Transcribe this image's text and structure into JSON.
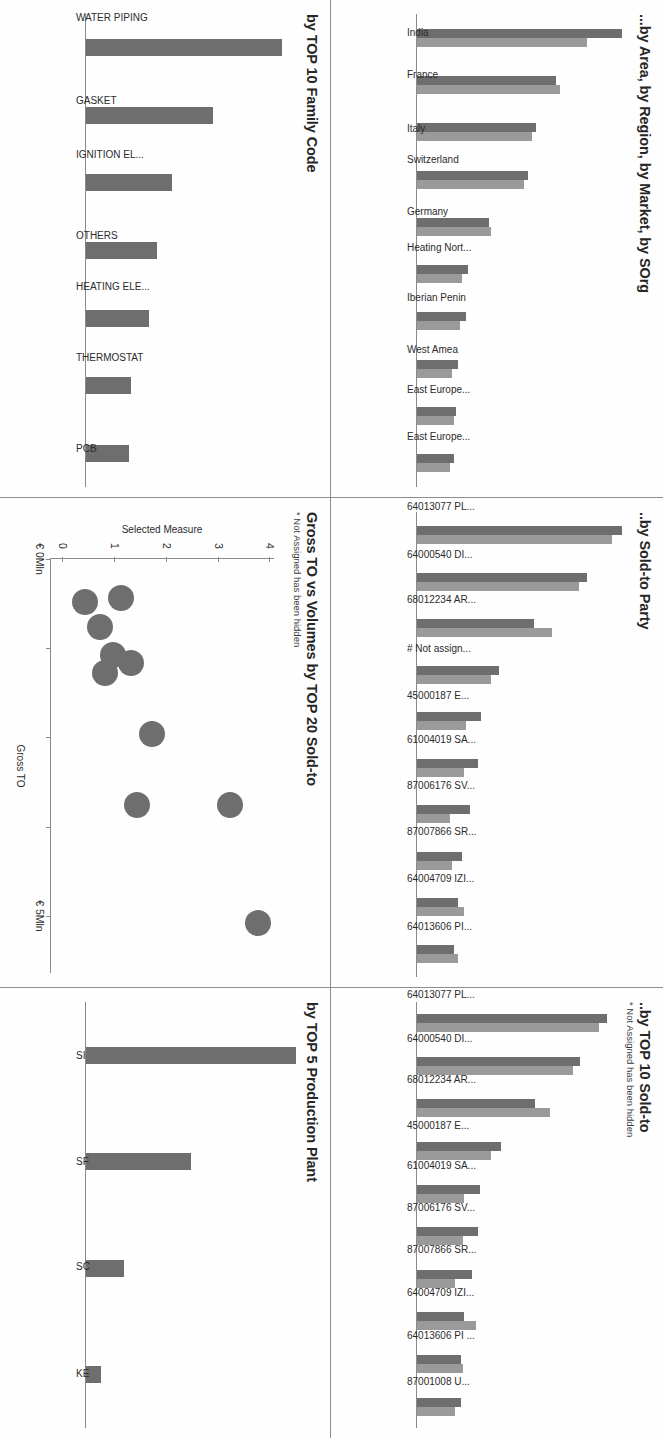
{
  "theme": {
    "series1_color": "#6e6e6e",
    "series2_color": "#9a9a9a",
    "axis_color": "#8a8a8a",
    "text_color": "#262626",
    "background": "#ffffff"
  },
  "panels": {
    "area_region_market_sorg": {
      "title": "...by Area, by Region, by Market, by SOrg",
      "subtitle": ""
    },
    "sold_to_party": {
      "title": "..by Sold-to Party",
      "subtitle": ""
    },
    "top10_sold_to": {
      "title": "..by TOP 10 Sold-to",
      "subtitle": "* Not Assigned has been hidden"
    },
    "family_code": {
      "title": "by TOP 10 Family Code",
      "subtitle": ""
    },
    "gross_to_vs_volumes": {
      "title": "Gross TO vs Volumes by TOP 20 Sold-to",
      "subtitle": "* Not Assigned has been hidden"
    },
    "production_plant": {
      "title": "by TOP 5 Production Plant",
      "subtitle": ""
    }
  },
  "chart_data": [
    {
      "id": "area_region_market_sorg",
      "type": "bar",
      "title": "...by Area, by Region, by Market, by SOrg",
      "xlabel": "",
      "ylabel": "",
      "grid": false,
      "legend": "none",
      "categories": [
        "India",
        "France",
        "Italy",
        "Switzerland",
        "Germany",
        "Heating Nort...",
        "Iberian Penin",
        "West Amea",
        "East Europe...",
        "East Europe..."
      ],
      "series": [
        {
          "name": "Series 1",
          "values": [
            100,
            68,
            58,
            54,
            35,
            25,
            24,
            20,
            19,
            18
          ]
        },
        {
          "name": "Series 2",
          "values": [
            83,
            70,
            56,
            52,
            36,
            22,
            21,
            17,
            18,
            16
          ]
        }
      ],
      "ylim": [
        0,
        100
      ]
    },
    {
      "id": "sold_to_party",
      "type": "bar",
      "title": "..by Sold-to Party",
      "xlabel": "",
      "ylabel": "",
      "grid": false,
      "legend": "none",
      "categories": [
        "64013077 PL...",
        "64000540 DI...",
        "68012234 AR...",
        "# Not assign...",
        "45000187 E...",
        "61004019 SA...",
        "87006176 SV...",
        "87007866 SR...",
        "64004709 IZI...",
        "64013606 PI..."
      ],
      "series": [
        {
          "name": "Series 1",
          "values": [
            100,
            83,
            57,
            40,
            31,
            30,
            26,
            22,
            20,
            18
          ]
        },
        {
          "name": "Series 2",
          "values": [
            95,
            79,
            66,
            36,
            24,
            23,
            16,
            17,
            23,
            20
          ]
        }
      ],
      "ylim": [
        0,
        100
      ]
    },
    {
      "id": "top10_sold_to",
      "type": "bar",
      "title": "..by TOP 10 Sold-to",
      "subtitle": "* Not Assigned has been hidden",
      "xlabel": "",
      "ylabel": "",
      "grid": false,
      "legend": "none",
      "categories": [
        "64013077 PL...",
        "64000540 DI...",
        "68012234 AR...",
        "45000187 E...",
        "61004019 SA...",
        "87006176 SV...",
        "87007866 SR...",
        "64004709 IZI...",
        "64013606 PI ...",
        "87001008 U..."
      ],
      "series": [
        {
          "name": "Series 1",
          "values": [
            100,
            86,
            62,
            44,
            33,
            32,
            29,
            25,
            23,
            23
          ]
        },
        {
          "name": "Series 2",
          "values": [
            96,
            82,
            70,
            39,
            25,
            24,
            20,
            31,
            24,
            20
          ]
        }
      ],
      "ylim": [
        0,
        100
      ]
    },
    {
      "id": "family_code",
      "type": "bar",
      "title": "by TOP 10 Family Code",
      "xlabel": "",
      "ylabel": "",
      "grid": false,
      "legend": "none",
      "categories": [
        "WATER PIPING",
        "GASKET",
        "IGNITION EL...",
        "OTHERS",
        "HEATING ELE...",
        "THERMOSTAT",
        "PCB"
      ],
      "series": [
        {
          "name": "Series 1",
          "values": [
            100,
            65,
            44,
            36,
            32,
            23,
            22
          ]
        }
      ],
      "ylim": [
        0,
        100
      ]
    },
    {
      "id": "gross_to_vs_volumes",
      "type": "scatter",
      "title": "Gross TO vs Volumes by TOP 20 Sold-to",
      "subtitle": "* Not Assigned has been hidden",
      "xlabel": "Gross TO",
      "ylabel": "Selected Measure",
      "grid": false,
      "legend": "none",
      "xticks": [
        "€ 0Mln",
        "",
        "",
        "",
        "€ 5Mln"
      ],
      "xtick_values": [
        0,
        1.25,
        2.5,
        3.75,
        5
      ],
      "yticks": [
        "0",
        "1",
        "2",
        "3",
        "4"
      ],
      "ylim": [
        0,
        4.3
      ],
      "xlim": [
        0,
        5.8
      ],
      "points": [
        {
          "x": 5.1,
          "y": 4.0
        },
        {
          "x": 3.45,
          "y": 3.45
        },
        {
          "x": 3.45,
          "y": 1.65
        },
        {
          "x": 2.45,
          "y": 1.95
        },
        {
          "x": 1.45,
          "y": 1.55
        },
        {
          "x": 1.35,
          "y": 1.2
        },
        {
          "x": 1.6,
          "y": 1.05
        },
        {
          "x": 0.95,
          "y": 0.95
        },
        {
          "x": 0.55,
          "y": 1.35
        },
        {
          "x": 0.6,
          "y": 0.65
        }
      ]
    },
    {
      "id": "production_plant",
      "type": "bar",
      "title": "by TOP 5 Production Plant",
      "xlabel": "",
      "ylabel": "",
      "grid": false,
      "legend": "none",
      "categories": [
        "SI",
        "SF",
        "SC",
        "KE"
      ],
      "series": [
        {
          "name": "Series 1",
          "values": [
            100,
            50,
            18,
            7
          ]
        }
      ],
      "ylim": [
        0,
        100
      ]
    }
  ]
}
